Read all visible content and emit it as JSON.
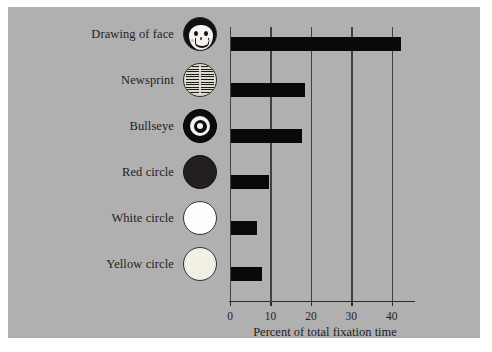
{
  "figure": {
    "background_color": "#b0b0b0",
    "page_color": "#ffffff",
    "bar_color": "#0a0909",
    "text_color": "#231f1d"
  },
  "chart_data": {
    "type": "bar",
    "orientation": "horizontal",
    "title": "",
    "subtitle": "",
    "xlabel": "Percent of total fixation time",
    "ylabel": "",
    "categories": [
      "Drawing of face",
      "Newsprint",
      "Bullseye",
      "Red circle",
      "White circle",
      "Yellow circle"
    ],
    "values": [
      42,
      18.3,
      17.5,
      9.5,
      6.4,
      7.6
    ],
    "xlim": [
      0,
      45
    ],
    "xticks": [
      0,
      10,
      20,
      30,
      40
    ],
    "xticklabels": [
      "0",
      "10",
      "20",
      "30",
      "40"
    ],
    "grid": "vertical gridlines at each x tick",
    "legend": "none",
    "icons": [
      "drawing-of-face-icon",
      "newsprint-icon",
      "bullseye-icon",
      "red-circle-icon",
      "white-circle-icon",
      "yellow-circle-icon"
    ]
  }
}
